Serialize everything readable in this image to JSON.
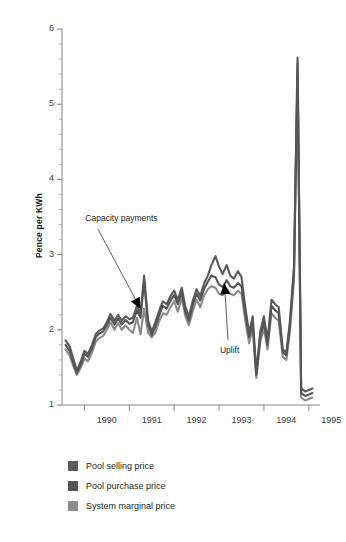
{
  "chart_data": {
    "type": "line",
    "title": "",
    "xlabel": "",
    "ylabel": "Pence per KWh",
    "xlim": [
      1989.5,
      1995.25
    ],
    "ylim": [
      1,
      6
    ],
    "ytick_values": [
      1,
      2,
      3,
      4,
      5,
      6
    ],
    "ytick_labels": [
      "1",
      "2",
      "3",
      "4",
      "5",
      "6"
    ],
    "yminor_step": 0.2,
    "xtick_values": [
      1990,
      1991,
      1992,
      1993,
      1994,
      1995
    ],
    "xtick_labels": [
      "1990",
      "1991",
      "1992",
      "1993",
      "1994",
      "1995"
    ],
    "xtick_label_offset": 0.5,
    "grid": false,
    "legend_position": "below",
    "annotations": [
      {
        "text": "Capacity payments",
        "text_x": 1990.02,
        "text_y": 3.48,
        "arrow_to_x": 1991.25,
        "arrow_to_y": 2.28,
        "arrow_from_x": 1990.3,
        "arrow_from_y": 3.34
      },
      {
        "text": "Uplift",
        "text_x": 1993.02,
        "text_y": 1.72,
        "arrow_to_x": 1993.12,
        "arrow_to_y": 2.62,
        "arrow_from_x": 1993.2,
        "arrow_from_y": 1.86
      }
    ],
    "x": [
      1989.58,
      1989.67,
      1989.75,
      1989.83,
      1989.92,
      1990.0,
      1990.08,
      1990.17,
      1990.25,
      1990.33,
      1990.42,
      1990.5,
      1990.58,
      1990.67,
      1990.75,
      1990.83,
      1990.92,
      1991.0,
      1991.08,
      1991.17,
      1991.25,
      1991.33,
      1991.42,
      1991.5,
      1991.58,
      1991.67,
      1991.75,
      1991.83,
      1991.92,
      1992.0,
      1992.08,
      1992.17,
      1992.25,
      1992.33,
      1992.42,
      1992.5,
      1992.58,
      1992.67,
      1992.75,
      1992.83,
      1992.92,
      1993.0,
      1993.08,
      1993.17,
      1993.25,
      1993.33,
      1993.42,
      1993.5,
      1993.58,
      1993.67,
      1993.75,
      1993.83,
      1993.92,
      1994.0,
      1994.08,
      1994.17,
      1994.25,
      1994.33,
      1994.42,
      1994.5,
      1994.58,
      1994.67,
      1994.75,
      1994.83,
      1994.92,
      1995.0,
      1995.08
    ],
    "series": [
      {
        "name": "Pool selling price",
        "color": "#5a5a5a",
        "values": [
          1.86,
          1.78,
          1.62,
          1.46,
          1.58,
          1.72,
          1.68,
          1.8,
          1.94,
          1.99,
          2.02,
          2.1,
          2.21,
          2.12,
          2.2,
          2.12,
          2.18,
          2.14,
          2.16,
          2.32,
          2.22,
          2.72,
          2.12,
          1.98,
          2.1,
          2.26,
          2.38,
          2.34,
          2.45,
          2.52,
          2.4,
          2.56,
          2.3,
          2.18,
          2.4,
          2.54,
          2.45,
          2.62,
          2.72,
          2.86,
          2.98,
          2.84,
          2.74,
          2.86,
          2.72,
          2.68,
          2.78,
          2.7,
          2.32,
          1.96,
          2.18,
          1.44,
          1.98,
          2.18,
          1.86,
          2.4,
          2.34,
          2.3,
          1.74,
          1.7,
          2.12,
          2.84,
          5.62,
          1.22,
          1.18,
          1.2,
          1.22
        ]
      },
      {
        "name": "Pool purchase price",
        "color": "#555555",
        "values": [
          1.8,
          1.72,
          1.56,
          1.42,
          1.54,
          1.68,
          1.64,
          1.76,
          1.9,
          1.95,
          1.98,
          2.06,
          2.16,
          2.07,
          2.15,
          2.07,
          2.13,
          2.08,
          2.1,
          2.26,
          2.16,
          2.64,
          2.06,
          1.93,
          2.04,
          2.2,
          2.32,
          2.28,
          2.39,
          2.46,
          2.34,
          2.5,
          2.24,
          2.12,
          2.34,
          2.48,
          2.39,
          2.55,
          2.64,
          2.72,
          2.7,
          2.6,
          2.57,
          2.66,
          2.58,
          2.56,
          2.62,
          2.58,
          2.24,
          1.9,
          2.1,
          1.4,
          1.92,
          2.1,
          1.8,
          2.32,
          2.26,
          2.22,
          1.7,
          1.66,
          2.06,
          2.76,
          5.54,
          1.16,
          1.12,
          1.14,
          1.16
        ]
      },
      {
        "name": "System marginal price",
        "color": "#8b8b8b",
        "values": [
          1.74,
          1.66,
          1.52,
          1.4,
          1.5,
          1.62,
          1.58,
          1.7,
          1.84,
          1.89,
          1.92,
          2.0,
          2.1,
          2.0,
          2.09,
          2.0,
          2.06,
          2.0,
          1.96,
          2.16,
          1.94,
          2.28,
          1.96,
          1.9,
          1.96,
          2.12,
          2.22,
          2.2,
          2.3,
          2.38,
          2.24,
          2.42,
          2.18,
          2.06,
          2.26,
          2.4,
          2.3,
          2.46,
          2.54,
          2.58,
          2.56,
          2.48,
          2.46,
          2.54,
          2.48,
          2.46,
          2.52,
          2.48,
          2.14,
          1.82,
          2.02,
          1.36,
          1.84,
          2.02,
          1.74,
          2.22,
          2.16,
          2.12,
          1.64,
          1.6,
          1.98,
          2.66,
          5.4,
          1.1,
          1.06,
          1.08,
          1.1
        ]
      }
    ]
  },
  "legend": {
    "items": [
      {
        "label": "Pool selling price",
        "color": "#5a5a5a"
      },
      {
        "label": "Pool purchase price",
        "color": "#555555"
      },
      {
        "label": "System marginal price",
        "color": "#8b8b8b"
      }
    ]
  }
}
